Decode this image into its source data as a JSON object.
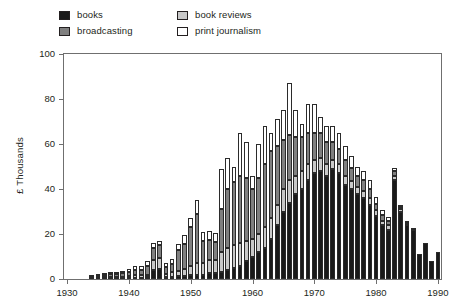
{
  "chart_data": {
    "type": "bar",
    "subtype": "stacked-vertical",
    "title": "",
    "xlabel": "",
    "ylabel": "£ Thousands",
    "ylim": [
      0,
      100
    ],
    "yticks": [
      0,
      20,
      40,
      60,
      80,
      100
    ],
    "xlim": [
      1930,
      1990
    ],
    "xticks": [
      1930,
      1940,
      1950,
      1960,
      1970,
      1980,
      1990
    ],
    "grid": false,
    "legend_position": "top-left",
    "legend": [
      "books",
      "broadcasting",
      "book reviews",
      "print journalism"
    ],
    "stack_order_bottom_to_top": [
      "books",
      "book reviews",
      "broadcasting",
      "print journalism"
    ],
    "colors": {
      "books": "#1a1a1a",
      "broadcasting": "#808080",
      "book_reviews": "#c8c8c8",
      "print_journalism": "#ffffff",
      "axis": "#6f6f6f",
      "text": "#231f20"
    },
    "categories": [
      1930,
      1931,
      1932,
      1933,
      1934,
      1935,
      1936,
      1937,
      1938,
      1939,
      1940,
      1941,
      1942,
      1943,
      1944,
      1945,
      1946,
      1947,
      1948,
      1949,
      1950,
      1951,
      1952,
      1953,
      1954,
      1955,
      1956,
      1957,
      1958,
      1959,
      1960,
      1961,
      1962,
      1963,
      1964,
      1965,
      1966,
      1967,
      1968,
      1969,
      1970,
      1971,
      1972,
      1973,
      1974,
      1975,
      1976,
      1977,
      1978,
      1979,
      1980,
      1981,
      1982,
      1983,
      1984,
      1985,
      1986,
      1987,
      1988,
      1989,
      1990
    ],
    "series": [
      {
        "name": "books",
        "color": "#1a1a1a",
        "values": [
          0,
          0,
          0,
          0,
          0.2,
          0.3,
          0.3,
          0.4,
          0.4,
          0.5,
          0.5,
          0.6,
          0.6,
          0.8,
          4.0,
          4.5,
          0.8,
          1.0,
          1.2,
          1.5,
          2.0,
          2.0,
          2.0,
          2.5,
          2.5,
          3.0,
          4.0,
          5.0,
          6.0,
          8.0,
          10.0,
          12.0,
          14.0,
          18.0,
          24.0,
          30.0,
          34.0,
          38.0,
          40.0,
          44.0,
          47.0,
          48.0,
          46.0,
          49.0,
          47.0,
          42.0,
          40.0,
          38.0,
          36.0,
          33.0,
          28.0,
          24.0,
          22.0,
          44.0,
          30.0,
          24.0,
          22.0,
          11.0,
          16.0,
          8.0,
          12.0
        ]
      },
      {
        "name": "book reviews",
        "color": "#c8c8c8",
        "values": [
          0,
          0,
          0,
          0,
          0.2,
          0.3,
          0.4,
          0.5,
          0.5,
          0.6,
          0.8,
          1.0,
          1.0,
          1.2,
          4.5,
          5.0,
          1.5,
          2.0,
          2.5,
          3.0,
          4.0,
          5.0,
          5.0,
          6.0,
          6.0,
          9.0,
          10.0,
          10.0,
          10.0,
          9.0,
          8.0,
          8.0,
          9.0,
          9.0,
          9.0,
          10.0,
          10.0,
          8.0,
          8.0,
          7.0,
          6.0,
          6.0,
          5.0,
          4.0,
          4.0,
          4.0,
          3.5,
          3.0,
          3.0,
          3.0,
          2.5,
          2.0,
          2.0,
          2.0,
          1.0,
          0.5,
          0.5,
          0,
          0,
          0,
          0
        ]
      },
      {
        "name": "broadcasting",
        "color": "#808080",
        "values": [
          0,
          0,
          0,
          0,
          0.4,
          0.6,
          1.0,
          1.2,
          1.5,
          1.5,
          2.0,
          2.5,
          2.5,
          4.0,
          5.5,
          5.5,
          3.0,
          3.5,
          9.0,
          11.0,
          17.0,
          22.0,
          10.0,
          9.0,
          8.0,
          19.0,
          26.0,
          28.0,
          30.0,
          28.0,
          22.0,
          25.0,
          28.0,
          30.0,
          26.0,
          22.0,
          20.0,
          17.0,
          15.0,
          14.0,
          12.0,
          11.0,
          10.0,
          8.0,
          7.0,
          7.0,
          6.0,
          5.0,
          5.0,
          4.0,
          3.0,
          2.5,
          2.0,
          2.0,
          1.0,
          0.5,
          0,
          0,
          0,
          0,
          0
        ]
      },
      {
        "name": "print journalism",
        "color": "#ffffff",
        "values": [
          0,
          0,
          0,
          0,
          0.3,
          0.5,
          0.6,
          0.8,
          0.8,
          1.0,
          1.2,
          1.5,
          1.5,
          2.0,
          2.0,
          2.0,
          2.0,
          2.5,
          3.0,
          4.0,
          4.0,
          6.0,
          4.0,
          4.0,
          4.0,
          18.0,
          14.0,
          7.0,
          19.0,
          16.0,
          6.0,
          15.0,
          17.0,
          8.0,
          12.0,
          13.0,
          23.0,
          12.0,
          6.0,
          13.0,
          13.0,
          7.0,
          7.0,
          7.0,
          7.0,
          6.0,
          5.0,
          4.0,
          4.0,
          4.0,
          3.0,
          2.0,
          1.5,
          1.5,
          1.0,
          0.5,
          0,
          0,
          0,
          0,
          0
        ]
      }
    ],
    "totals": [
      0,
      0,
      0,
      0,
      1.1,
      1.7,
      2.3,
      2.9,
      3.2,
      3.6,
      4.5,
      5.6,
      5.6,
      8.0,
      16.0,
      17.0,
      7.3,
      9.0,
      15.7,
      19.5,
      27.0,
      35.0,
      21.0,
      21.5,
      20.5,
      49.0,
      54.0,
      50.0,
      65.0,
      61.0,
      46.0,
      60.0,
      68.0,
      65.0,
      71.0,
      75.0,
      87.0,
      75.0,
      69.0,
      78.0,
      78.0,
      72.0,
      68.0,
      68.0,
      65.0,
      59.0,
      54.5,
      50.0,
      48.0,
      44.0,
      36.5,
      30.5,
      27.5,
      49.5,
      33.0,
      25.5,
      22.5,
      11.0,
      16.0,
      8.0,
      12.0
    ]
  },
  "legend": {
    "items": [
      {
        "label": "books",
        "swatch": "books-swatch",
        "color": "#1a1a1a"
      },
      {
        "label": "broadcasting",
        "swatch": "broadcasting-swatch",
        "color": "#808080"
      },
      {
        "label": "book reviews",
        "swatch": "book-reviews-swatch",
        "color": "#c8c8c8"
      },
      {
        "label": "print journalism",
        "swatch": "print-journalism-swatch",
        "color": "#ffffff"
      }
    ]
  },
  "axes": {
    "y": {
      "label": "£ Thousands",
      "ticks": [
        "0",
        "20",
        "40",
        "60",
        "80",
        "100"
      ]
    },
    "x": {
      "label": "",
      "ticks": [
        "1930",
        "1940",
        "1950",
        "1960",
        "1970",
        "1980",
        "1990"
      ]
    }
  }
}
